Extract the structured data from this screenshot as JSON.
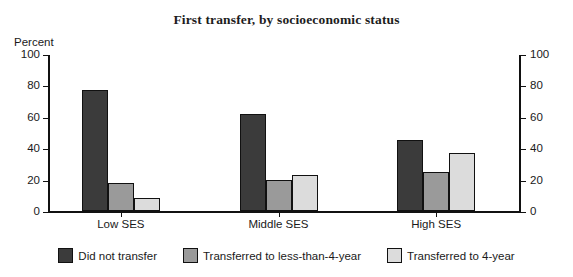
{
  "chart_data": {
    "type": "bar",
    "title": "First transfer, by socioeconomic status",
    "xlabel": "",
    "ylabel": "Percent",
    "ylim": [
      0,
      100
    ],
    "yticks": [
      0,
      20,
      40,
      60,
      80,
      100
    ],
    "grid": false,
    "legend_position": "bottom",
    "dual_axis": true,
    "right_axis_label": "",
    "right_yticks": [
      0,
      20,
      40,
      60,
      80,
      100
    ],
    "categories": [
      "Low SES",
      "Middle SES",
      "High SES"
    ],
    "series": [
      {
        "name": "Did not transfer",
        "color": "#3b3b3b",
        "values": [
          77,
          62,
          45
        ]
      },
      {
        "name": "Transferred to less-than-4-year",
        "color": "#9a9a9a",
        "values": [
          18,
          20,
          25
        ]
      },
      {
        "name": "Transferred to 4-year",
        "color": "#dcdcdc",
        "values": [
          8,
          23,
          37
        ]
      }
    ]
  },
  "axis": {
    "unit_label": "Percent",
    "tick_labels": [
      "100",
      "80",
      "60",
      "40",
      "20",
      "0"
    ]
  },
  "colors": {
    "axis": "#111111",
    "text": "#1a1a1a",
    "background": "#ffffff",
    "series_dark": "#3b3b3b",
    "series_medium": "#9a9a9a",
    "series_light": "#dcdcdc"
  }
}
